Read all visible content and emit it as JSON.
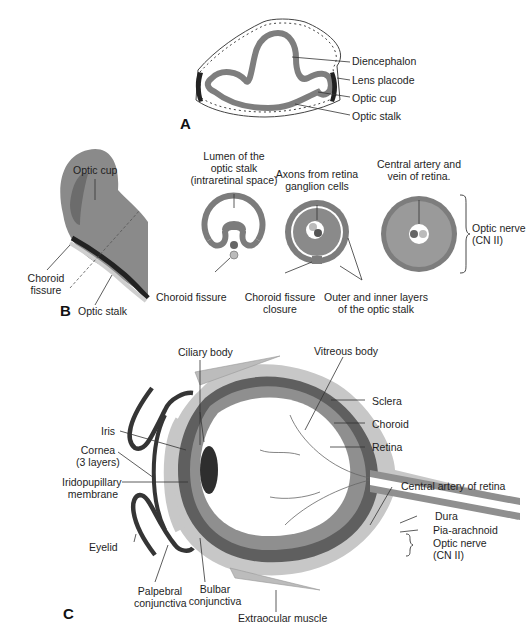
{
  "figure": {
    "panels": [
      {
        "id": "A",
        "letter": "A",
        "labels": {
          "diencephalon": "Diencephalon",
          "lens_placode": "Lens placode",
          "optic_cup": "Optic cup",
          "optic_stalk": "Optic stalk"
        }
      },
      {
        "id": "B",
        "letter": "B",
        "labels": {
          "optic_cup": "Optic cup",
          "choroid_fissure_1": "Choroid",
          "choroid_fissure_2": "fissure",
          "optic_stalk": "Optic stalk",
          "lumen_1": "Lumen of the",
          "lumen_2": "optic stalk",
          "lumen_3": "(intraretinal space)",
          "choroid_fissure_b": "Choroid fissure",
          "axons_1": "Axons from retina",
          "axons_2": "ganglion cells",
          "closure_1": "Choroid fissure",
          "closure_2": "closure",
          "layers_1": "Outer and inner layers",
          "layers_2": "of the optic stalk",
          "central_1": "Central artery and",
          "central_2": "vein of retina.",
          "optic_nerve_1": "Optic nerve",
          "optic_nerve_2": "(CN II)"
        }
      },
      {
        "id": "C",
        "letter": "C",
        "labels": {
          "ciliary_body": "Ciliary body",
          "vitreous_body": "Vitreous body",
          "sclera": "Sclera",
          "choroid": "Choroid",
          "retina": "Retina",
          "iris": "Iris",
          "cornea_1": "Cornea",
          "cornea_2": "(3 layers)",
          "iridopupillary_1": "Iridopupillary",
          "iridopupillary_2": "membrane",
          "central_artery": "Central artery of retina",
          "dura": "Dura",
          "pia_arachnoid": "Pia-arachnoid",
          "optic_nerve_1": "Optic nerve",
          "optic_nerve_2": "(CN II)",
          "eyelid": "Eyelid",
          "palpebral_1": "Palpebral",
          "palpebral_2": "conjunctiva",
          "bulbar_1": "Bulbar",
          "bulbar_2": "conjunctiva",
          "extraocular_muscle": "Extraocular muscle"
        }
      }
    ],
    "colors": {
      "dark_gray": "#6f6f6f",
      "mid_gray": "#8c8c8c",
      "light_gray": "#c4c4c4",
      "black_structure": "#2a2a2a",
      "line": "#333333"
    }
  }
}
